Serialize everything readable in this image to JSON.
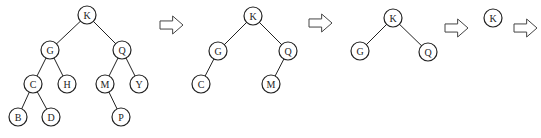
{
  "diagram": {
    "type": "binary-tree-sequence",
    "node_radius": 9,
    "trees": [
      {
        "name": "tree-1",
        "nodes": [
          {
            "id": "K",
            "label": "K",
            "x": 87,
            "y": 15
          },
          {
            "id": "G",
            "label": "G",
            "x": 50,
            "y": 50
          },
          {
            "id": "Q",
            "label": "Q",
            "x": 122,
            "y": 50
          },
          {
            "id": "C",
            "label": "C",
            "x": 33,
            "y": 84
          },
          {
            "id": "H",
            "label": "H",
            "x": 67,
            "y": 84
          },
          {
            "id": "M",
            "label": "M",
            "x": 105,
            "y": 84
          },
          {
            "id": "Y",
            "label": "Y",
            "x": 139,
            "y": 84
          },
          {
            "id": "B",
            "label": "B",
            "x": 18,
            "y": 117
          },
          {
            "id": "D",
            "label": "D",
            "x": 51,
            "y": 117
          },
          {
            "id": "P",
            "label": "P",
            "x": 121,
            "y": 117
          }
        ],
        "edges": [
          [
            "K",
            "G"
          ],
          [
            "K",
            "Q"
          ],
          [
            "G",
            "C"
          ],
          [
            "G",
            "H"
          ],
          [
            "Q",
            "M"
          ],
          [
            "Q",
            "Y"
          ],
          [
            "C",
            "B"
          ],
          [
            "C",
            "D"
          ],
          [
            "M",
            "P"
          ]
        ]
      },
      {
        "name": "tree-2",
        "nodes": [
          {
            "id": "K",
            "label": "K",
            "x": 253,
            "y": 16
          },
          {
            "id": "G",
            "label": "G",
            "x": 218,
            "y": 51
          },
          {
            "id": "Q",
            "label": "Q",
            "x": 288,
            "y": 51
          },
          {
            "id": "C",
            "label": "C",
            "x": 201,
            "y": 84
          },
          {
            "id": "M",
            "label": "M",
            "x": 271,
            "y": 84
          }
        ],
        "edges": [
          [
            "K",
            "G"
          ],
          [
            "K",
            "Q"
          ],
          [
            "G",
            "C"
          ],
          [
            "Q",
            "M"
          ]
        ]
      },
      {
        "name": "tree-3",
        "nodes": [
          {
            "id": "K",
            "label": "K",
            "x": 393,
            "y": 18
          },
          {
            "id": "G",
            "label": "G",
            "x": 360,
            "y": 51
          },
          {
            "id": "Q",
            "label": "Q",
            "x": 428,
            "y": 52
          }
        ],
        "edges": [
          [
            "K",
            "G"
          ],
          [
            "K",
            "Q"
          ]
        ]
      },
      {
        "name": "tree-4",
        "nodes": [
          {
            "id": "K",
            "label": "K",
            "x": 493,
            "y": 18
          }
        ],
        "edges": []
      }
    ],
    "arrows": [
      {
        "x": 160,
        "y": 25,
        "w": 23,
        "h": 18
      },
      {
        "x": 309,
        "y": 23,
        "w": 23,
        "h": 18
      },
      {
        "x": 445,
        "y": 28,
        "w": 23,
        "h": 18
      },
      {
        "x": 514,
        "y": 28,
        "w": 23,
        "h": 18
      }
    ]
  }
}
